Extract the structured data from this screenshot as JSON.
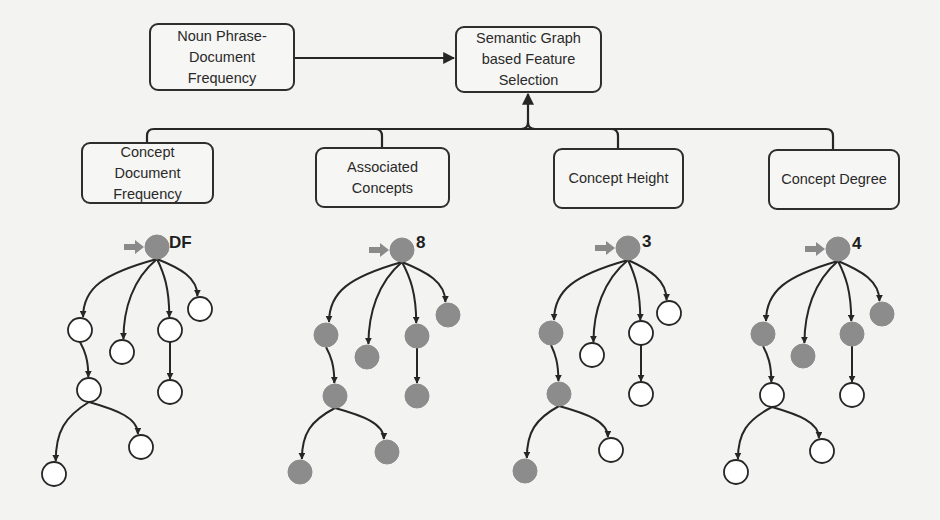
{
  "diagram": {
    "title_boxes": [
      {
        "id": "np_df",
        "lines": [
          "Noun Phrase-",
          "Document",
          "Frequency"
        ],
        "x": 149,
        "y": 23,
        "w": 146,
        "h": 68
      },
      {
        "id": "sgfs",
        "lines": [
          "Semantic Graph",
          "based Feature",
          "Selection"
        ],
        "x": 455,
        "y": 26,
        "w": 147,
        "h": 67
      }
    ],
    "feature_boxes": [
      {
        "id": "cdf",
        "lines": [
          "Concept",
          "Document",
          "Frequency"
        ],
        "x": 81,
        "y": 142,
        "w": 133,
        "h": 62,
        "connector_x": 147
      },
      {
        "id": "ac",
        "lines": [
          "Associated",
          "Concepts"
        ],
        "x": 315,
        "y": 147,
        "w": 135,
        "h": 61,
        "connector_x": 382
      },
      {
        "id": "ch",
        "lines": [
          "Concept Height"
        ],
        "x": 553,
        "y": 148,
        "w": 131,
        "h": 61,
        "connector_x": 618
      },
      {
        "id": "cd",
        "lines": [
          "Concept Degree"
        ],
        "x": 768,
        "y": 149,
        "w": 132,
        "h": 61,
        "connector_x": 833
      }
    ],
    "bus": {
      "y": 129,
      "x1": 147,
      "x2": 833,
      "merge_x": 528
    },
    "colors": {
      "line": "#262626",
      "node_filled": "#8c8c8c",
      "node_empty": "#ffffff",
      "node_stroke": "#262626",
      "root_pointer": "#8a8a8a"
    },
    "trees": [
      {
        "label": "DF",
        "label_pos": [
          169,
          245
        ],
        "nodes": [
          {
            "x": 157,
            "y": 247,
            "filled": true
          },
          {
            "x": 80,
            "y": 330,
            "filled": false
          },
          {
            "x": 122,
            "y": 352,
            "filled": false
          },
          {
            "x": 170,
            "y": 330,
            "filled": false
          },
          {
            "x": 200,
            "y": 309,
            "filled": false
          },
          {
            "x": 89,
            "y": 390,
            "filled": false
          },
          {
            "x": 170,
            "y": 392,
            "filled": false
          },
          {
            "x": 54,
            "y": 474,
            "filled": false
          },
          {
            "x": 141,
            "y": 447,
            "filled": false
          }
        ]
      },
      {
        "label": "8",
        "label_pos": [
          416,
          245
        ],
        "nodes": [
          {
            "x": 402,
            "y": 250,
            "filled": true
          },
          {
            "x": 326,
            "y": 335,
            "filled": true
          },
          {
            "x": 367,
            "y": 357,
            "filled": true
          },
          {
            "x": 417,
            "y": 336,
            "filled": true
          },
          {
            "x": 448,
            "y": 315,
            "filled": true
          },
          {
            "x": 335,
            "y": 396,
            "filled": true
          },
          {
            "x": 417,
            "y": 396,
            "filled": true
          },
          {
            "x": 300,
            "y": 472,
            "filled": true
          },
          {
            "x": 387,
            "y": 452,
            "filled": true
          }
        ]
      },
      {
        "label": "3",
        "label_pos": [
          642,
          244
        ],
        "nodes": [
          {
            "x": 628,
            "y": 248,
            "filled": true
          },
          {
            "x": 551,
            "y": 333,
            "filled": true
          },
          {
            "x": 592,
            "y": 355,
            "filled": false
          },
          {
            "x": 641,
            "y": 333,
            "filled": false
          },
          {
            "x": 669,
            "y": 313,
            "filled": false
          },
          {
            "x": 559,
            "y": 394,
            "filled": true
          },
          {
            "x": 641,
            "y": 394,
            "filled": false
          },
          {
            "x": 525,
            "y": 471,
            "filled": true
          },
          {
            "x": 611,
            "y": 450,
            "filled": false
          }
        ]
      },
      {
        "label": "4",
        "label_pos": [
          852,
          246
        ],
        "nodes": [
          {
            "x": 838,
            "y": 249,
            "filled": true
          },
          {
            "x": 763,
            "y": 334,
            "filled": true
          },
          {
            "x": 803,
            "y": 356,
            "filled": true
          },
          {
            "x": 852,
            "y": 334,
            "filled": true
          },
          {
            "x": 882,
            "y": 314,
            "filled": true
          },
          {
            "x": 772,
            "y": 395,
            "filled": false
          },
          {
            "x": 852,
            "y": 395,
            "filled": false
          },
          {
            "x": 736,
            "y": 472,
            "filled": false
          },
          {
            "x": 822,
            "y": 451,
            "filled": false
          }
        ]
      }
    ],
    "tree_edges": [
      [
        0,
        1
      ],
      [
        0,
        2
      ],
      [
        0,
        3
      ],
      [
        0,
        4
      ],
      [
        1,
        5
      ],
      [
        3,
        6
      ],
      [
        5,
        7
      ],
      [
        5,
        8
      ]
    ]
  }
}
